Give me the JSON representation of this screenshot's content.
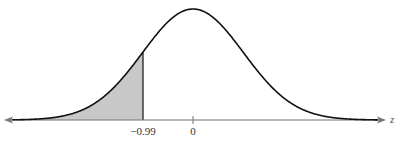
{
  "chart_data": {
    "type": "area",
    "title": "",
    "xlabel": "z",
    "ylabel": "",
    "distribution": {
      "name": "standard normal",
      "mean": 0,
      "sd": 1
    },
    "shaded_region": {
      "from": "-inf",
      "to": -0.99,
      "side": "left"
    },
    "tick_labels": [
      "-0.99",
      "0"
    ],
    "ticks": [
      -0.99,
      0
    ],
    "xlim": [
      -3.7,
      3.6
    ],
    "grid": false,
    "legend": null
  },
  "labels": {
    "tick_neg": "−0.99",
    "tick_zero": "0",
    "axis": "z"
  },
  "colors": {
    "curve": "#111111",
    "shade": "#c8c8c8",
    "axis": "#777777"
  }
}
